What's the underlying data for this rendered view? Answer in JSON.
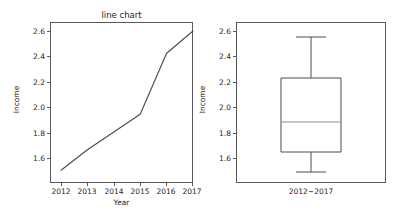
{
  "figure": {
    "background_color": "#ffffff",
    "axis_color": "#5a5a5a",
    "line_color": "#4d4d4d",
    "median_color": "#8c8c8c",
    "width": 408,
    "height": 212
  },
  "chart_data": [
    {
      "type": "line",
      "title": "line chart",
      "xlabel": "Year",
      "ylabel": "Income",
      "x": [
        "2012",
        "2013",
        "2014",
        "2015",
        "2016",
        "2017"
      ],
      "values": [
        1.5,
        1.66,
        1.8,
        1.94,
        2.42,
        2.6
      ],
      "xtick_labels": [
        "2012",
        "2013",
        "2014",
        "2015",
        "2016",
        "2017"
      ],
      "ytick_labels": [
        "1.6",
        "1.8",
        "2.0",
        "2.2",
        "2.4",
        "2.6"
      ],
      "ytick_values": [
        1.6,
        1.8,
        2.0,
        2.2,
        2.4,
        2.6
      ],
      "ylim": [
        1.44,
        2.66
      ],
      "xlim": [
        2011.75,
        2017.25
      ],
      "grid": false,
      "legend": false
    },
    {
      "type": "box",
      "title": "",
      "xlabel": "",
      "ylabel": "Income",
      "categories": [
        "2012~2017"
      ],
      "boxes": [
        {
          "label": "2012~2017",
          "whisker_low": 1.48,
          "q1": 1.64,
          "median": 1.87,
          "q3": 2.27,
          "whisker_high": 2.55,
          "outliers": []
        }
      ],
      "xtick_labels": [
        "2012~2017"
      ],
      "ytick_labels": [
        "1.6",
        "1.8",
        "2.0",
        "2.2",
        "2.4",
        "2.6"
      ],
      "ytick_values": [
        1.6,
        1.8,
        2.0,
        2.2,
        2.4,
        2.6
      ],
      "ylim": [
        1.44,
        2.66
      ],
      "grid": false,
      "legend": false
    }
  ],
  "line_panel": {
    "title": "line chart",
    "xlabel": "Year",
    "ylabel": "Income",
    "ytick_labels": [
      "2.6",
      "2.4",
      "2.2",
      "2.0",
      "1.8",
      "1.6"
    ],
    "xtick_labels": [
      "2012",
      "2013",
      "2014",
      "2015",
      "2016",
      "2017"
    ],
    "path": "M 0,139.2 L 26.4,118.8 L 52.8,101.0 L 79.2,83.2 L 105.6,22.2 L 132,0"
  },
  "box_panel": {
    "ylabel": "Income",
    "ytick_labels": [
      "2.6",
      "2.4",
      "2.2",
      "2.0",
      "1.8",
      "1.6"
    ],
    "xtick_labels": [
      "2012~2017"
    ],
    "box_path": "M 10,47 L 70,47 L 70,121 L 10,121 Z",
    "median_path": "M 10,91 L 70,91",
    "whisker_path": "M 40,47 L 40,6 M 25,6 L 55,6 M 40,121 L 40,141 M 25,141 L 55,141"
  }
}
